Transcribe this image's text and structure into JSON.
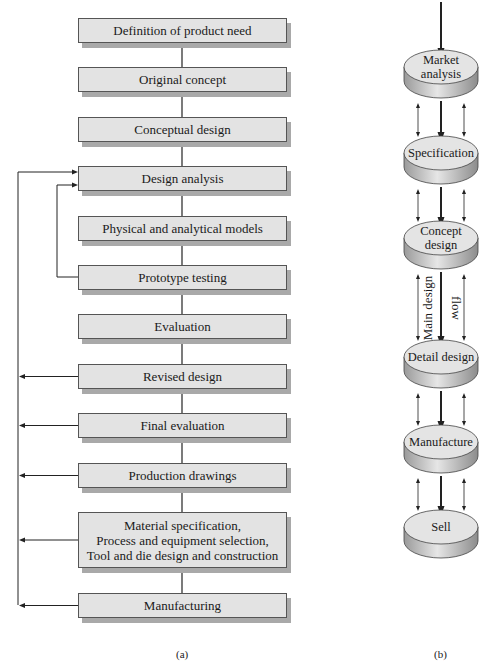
{
  "diagram_a": {
    "caption": "(a)",
    "steps": [
      {
        "label": "Definition of product need",
        "top": 18,
        "height": 25
      },
      {
        "label": "Original concept",
        "top": 67,
        "height": 25
      },
      {
        "label": "Conceptual design",
        "top": 117,
        "height": 25
      },
      {
        "label": "Design analysis",
        "top": 166,
        "height": 25
      },
      {
        "label": "Physical and analytical models",
        "top": 216,
        "height": 25
      },
      {
        "label": "Prototype testing",
        "top": 265,
        "height": 25
      },
      {
        "label": "Evaluation",
        "top": 314,
        "height": 25
      },
      {
        "label": "Revised design",
        "top": 364,
        "height": 25
      },
      {
        "label": "Final evaluation",
        "top": 413,
        "height": 25
      },
      {
        "label": "Production drawings",
        "top": 463,
        "height": 25
      },
      {
        "label": "Material specification,\nProcess and equipment selection,\nTool and die design and construction",
        "top": 512,
        "height": 56
      },
      {
        "label": "Manufacturing",
        "top": 593,
        "height": 25
      }
    ],
    "feedback": {
      "inner_loop": {
        "from": "Prototype testing",
        "to": "Design analysis"
      },
      "outer_loop": {
        "from": [
          "Revised design",
          "Final evaluation",
          "Production drawings",
          "Material specification, Process and equipment selection, Tool and die design and construction",
          "Manufacturing"
        ],
        "to": "Design analysis"
      }
    }
  },
  "diagram_b": {
    "caption": "(b)",
    "stages": [
      {
        "label": "Market\nanalysis",
        "top": 50
      },
      {
        "label": "Specification",
        "top": 136
      },
      {
        "label": "Concept\ndesign",
        "top": 221
      },
      {
        "label": "Detail design",
        "top": 340
      },
      {
        "label": "Manufacture",
        "top": 425
      },
      {
        "label": "Sell",
        "top": 510
      }
    ],
    "flow_label_1": "Main design",
    "flow_label_2": "flow"
  }
}
